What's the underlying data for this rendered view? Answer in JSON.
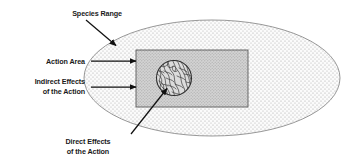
{
  "diagram": {
    "labels": {
      "species_range": "Species Range",
      "action_area": "Action Area",
      "indirect_effects_line1": "Indirect Effects",
      "indirect_effects_line2": "of the Action",
      "direct_effects_line1": "Direct Effects",
      "direct_effects_line2": "of the Action"
    },
    "shapes": {
      "species_range_ellipse": {
        "name": "species-range-ellipse",
        "cx": 212,
        "cy": 78,
        "rx": 128,
        "ry": 58,
        "fill": "#f2f2f2",
        "stroke": "#808080",
        "texture": "stipple-dots"
      },
      "action_area_rect": {
        "name": "action-area-rectangle",
        "x": 136,
        "y": 50,
        "width": 112,
        "height": 57,
        "fill": "#cfcfcf",
        "stroke": "#555555",
        "texture": "solid-gray"
      },
      "direct_effects_circle": {
        "name": "direct-effects-circle",
        "cx": 174,
        "cy": 78,
        "r": 18,
        "fill": "#d8d8d8",
        "stroke": "#333333",
        "texture": "squiggle-veins"
      }
    },
    "arrows": [
      {
        "name": "arrow-species-range",
        "from_x": 86,
        "from_y": 20,
        "to_x": 117,
        "to_y": 46,
        "color": "#111111"
      },
      {
        "name": "arrow-action-area",
        "from_x": 91,
        "from_y": 61,
        "to_x": 137,
        "to_y": 61,
        "color": "#111111"
      },
      {
        "name": "arrow-indirect-effects",
        "from_x": 91,
        "from_y": 87,
        "to_x": 137,
        "to_y": 87,
        "color": "#111111"
      },
      {
        "name": "arrow-direct-effects",
        "from_x": 131,
        "from_y": 134,
        "to_x": 168,
        "to_y": 88,
        "color": "#111111"
      }
    ],
    "colors": {
      "background": "#ffffff",
      "text": "#1a1a1a",
      "ellipse_fill": "#f2f2f2",
      "rect_fill": "#cfcfcf",
      "circle_fill": "#d8d8d8",
      "arrow": "#111111"
    }
  }
}
